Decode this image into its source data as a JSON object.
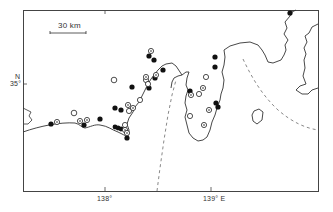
{
  "map": {
    "scale_bar": {
      "label": "30 km"
    },
    "axes": {
      "lat_label_top": "N",
      "lat_label": "35°",
      "lon_ticks": [
        {
          "label": "138°"
        },
        {
          "label": "139° E"
        }
      ]
    },
    "legend_markers": {
      "filled": "solid black circle",
      "open": "open circle",
      "dotted": "circle with center dot"
    },
    "colors": {
      "ink": "#222222",
      "frame": "#444444",
      "background": "#ffffff"
    }
  }
}
